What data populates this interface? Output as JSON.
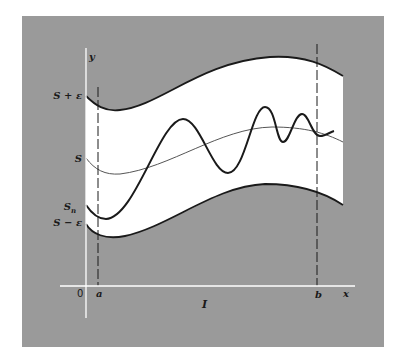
{
  "figure": {
    "background_color": "#9a9a9a",
    "band_color": "#ffffff",
    "curve_color": "#1a1a1a",
    "axis_color": "#ffffff"
  },
  "labels": {
    "y_axis": "y",
    "x_axis": "x",
    "origin": "0",
    "upper_bound": "S + ε",
    "limit_function": "S",
    "partial_sum": "S",
    "partial_sum_subscript": "n",
    "lower_bound": "S − ε",
    "point_a": "a",
    "point_b": "b",
    "interval": "I"
  }
}
